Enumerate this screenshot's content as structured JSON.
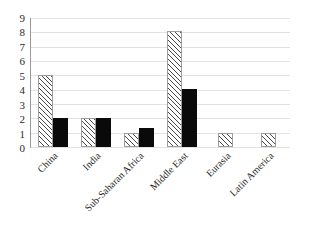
{
  "chart_data": {
    "type": "bar",
    "title": "",
    "subtitle": "",
    "xlabel": "",
    "ylabel": "",
    "ylim": [
      0,
      9
    ],
    "ytick_labels": [
      "9",
      "8",
      "7",
      "6",
      "5",
      "4",
      "3",
      "2",
      "1",
      "0"
    ],
    "ytick_values": [
      9,
      8,
      7,
      6,
      5,
      4,
      3,
      2,
      1,
      0
    ],
    "grid": true,
    "legend": "none",
    "legend_position": "none",
    "categories": [
      "China",
      "India",
      "Sub-Saharan Africa",
      "Middle East",
      "Eurasia",
      "Latin America"
    ],
    "series": [
      {
        "name": "series-1",
        "pattern": "diagonal-hatch",
        "color": "#ffffff",
        "edge_color": "#4a4a4a",
        "values": [
          5,
          2,
          1,
          8,
          1,
          1
        ]
      },
      {
        "name": "series-2",
        "pattern": "solid",
        "color": "#0a0a0a",
        "edge_color": "#0a0a0a",
        "values": [
          2,
          2,
          1.3,
          4,
          0,
          0
        ]
      }
    ]
  },
  "colors": {
    "background": "#ffffff",
    "gridline": "#e2e2e2",
    "axis": "#9a9a9a",
    "text": "#242424"
  }
}
